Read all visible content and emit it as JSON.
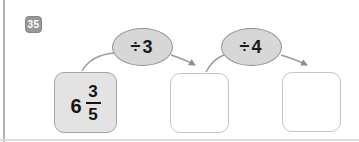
{
  "page": {
    "problem_number": "35",
    "start_box": {
      "whole": "6",
      "numerator": "3",
      "denominator": "5"
    },
    "operations": [
      {
        "label": "÷3"
      },
      {
        "label": "÷4"
      }
    ],
    "answer_boxes": [
      {
        "value": ""
      },
      {
        "value": ""
      }
    ],
    "colors": {
      "badge_bg": "#989898",
      "oval_fill": "#d7d7d7",
      "oval_border": "#919191",
      "start_box_fill": "#e3e3e3",
      "start_box_border": "#a6a6a6",
      "answer_box_border": "#c5c5c5",
      "arrow": "#9a9a9a",
      "rule": "#b3b3b3"
    }
  }
}
